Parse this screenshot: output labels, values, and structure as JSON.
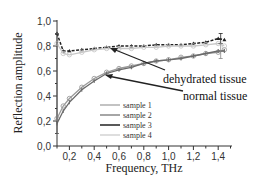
{
  "chart_data": {
    "type": "line",
    "title": "",
    "xlabel": "Frequency, THz",
    "ylabel": "Reflection amplitude",
    "xlim": [
      0.1,
      1.5
    ],
    "ylim": [
      0.0,
      1.0
    ],
    "x_ticks": [
      "0,2",
      "0,4",
      "0,6",
      "0,8",
      "1,0",
      "1,2",
      "1,4"
    ],
    "y_ticks": [
      "0,0",
      "0,2",
      "0,4",
      "0,6",
      "0,8",
      "1,0"
    ],
    "grid": false,
    "legend_position": "lower center (inside plot)",
    "x": [
      0.1,
      0.15,
      0.2,
      0.3,
      0.4,
      0.5,
      0.6,
      0.7,
      0.8,
      0.9,
      1.0,
      1.1,
      1.2,
      1.3,
      1.4,
      1.45
    ],
    "series": [
      {
        "name": "sample 1",
        "color": "#9a9a9a",
        "values": [
          0.22,
          0.32,
          0.38,
          0.47,
          0.54,
          0.59,
          0.62,
          0.64,
          0.66,
          0.68,
          0.69,
          0.71,
          0.72,
          0.74,
          0.75,
          0.77
        ]
      },
      {
        "name": "sample 2",
        "color": "#6a6a6a",
        "values": [
          0.18,
          0.28,
          0.35,
          0.45,
          0.52,
          0.58,
          0.61,
          0.63,
          0.66,
          0.68,
          0.69,
          0.7,
          0.72,
          0.74,
          0.76,
          0.76
        ]
      },
      {
        "name": "sample 3",
        "color": "#222222",
        "values": [
          0.9,
          0.76,
          0.76,
          0.77,
          0.78,
          0.79,
          0.8,
          0.8,
          0.8,
          0.81,
          0.81,
          0.81,
          0.82,
          0.83,
          0.86,
          0.85
        ]
      },
      {
        "name": "sample 4",
        "color": "#c8c8c8",
        "values": [
          0.82,
          0.74,
          0.73,
          0.75,
          0.77,
          0.78,
          0.78,
          0.78,
          0.79,
          0.79,
          0.8,
          0.8,
          0.8,
          0.81,
          0.82,
          0.8
        ]
      }
    ],
    "annotations": [
      {
        "text": "dehydrated tissue",
        "points_to": {
          "x": 0.55,
          "y": 0.79
        }
      },
      {
        "text": "normal tissue",
        "points_to": {
          "x": 0.52,
          "y": 0.57
        }
      }
    ]
  },
  "labels": {
    "xlabel": "Frequency, THz",
    "ylabel": "Reflection amplitude",
    "annot_dehydrated": "dehydrated tissue",
    "annot_normal": "normal tissue",
    "legend": [
      "sample 1",
      "sample 2",
      "sample 3",
      "sample 4"
    ],
    "x_ticks": [
      "0,2",
      "0,4",
      "0,6",
      "0,8",
      "1,0",
      "1,2",
      "1,4"
    ],
    "y_ticks": [
      "0,0",
      "0,2",
      "0,4",
      "0,6",
      "0,8",
      "1,0"
    ]
  }
}
